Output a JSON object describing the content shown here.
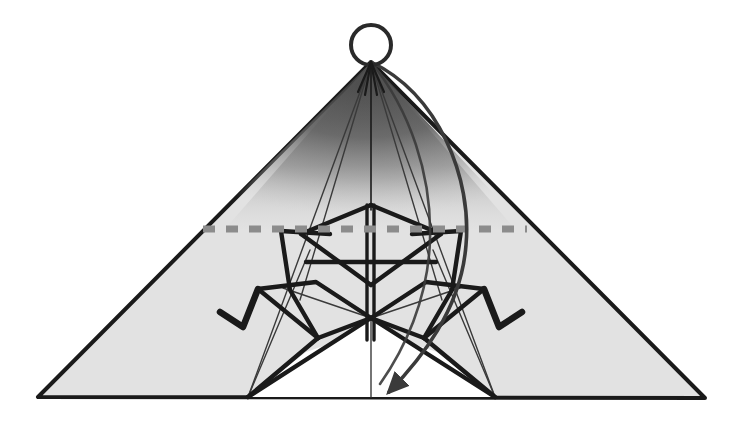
{
  "figure": {
    "title": "Origami crane folding diagram",
    "step_action": "fold-down-rotate",
    "background_color": "#ffffff"
  },
  "colors": {
    "paper_fill": "#e2e2e2",
    "paper_fill_white": "#ffffff",
    "outline": "#1a1a1a",
    "crease_line": "#1a1a1a",
    "thin_crease": "#3a3a3a",
    "shade_dark": "#555555",
    "shade_mid": "#8a8a8a",
    "dashed_fold_line": "#8c8c8c",
    "arrow_stroke": "#3a3a3a",
    "circle_stroke": "#2a2a2a"
  },
  "geometry": {
    "canvas": {
      "width": 744,
      "height": 434
    },
    "base_triangle": {
      "apex": [
        371,
        62
      ],
      "left": [
        38,
        397
      ],
      "right": [
        705,
        398
      ]
    },
    "apex_circle": {
      "cx": 371,
      "cy": 45,
      "r": 20
    },
    "dashed_fold_line": {
      "x1": 203,
      "y1": 229,
      "x2": 527,
      "y2": 229
    },
    "inner_white_bottom_left": [
      248,
      397
    ],
    "inner_white_bottom_right": [
      495,
      397
    ],
    "center_axis_x": 371,
    "arrow_tip": [
      388,
      398
    ]
  },
  "elements": {
    "apex_circle_label": "apex-highlight-circle",
    "dashed_label": "valley-fold-line",
    "arrow_label": "rotate-fold-arrow",
    "left_beak_label": "left-beak-fold",
    "right_beak_label": "right-beak-fold",
    "shading_label": "back-layer-shading"
  },
  "chart_data": {
    "type": "diagram",
    "title": "Origami crane folding diagram",
    "annotations": [
      "circle marks the top apex point",
      "gray dashed horizontal line marks the fold line",
      "curved arrow indicates folding the top point down and forward"
    ]
  }
}
